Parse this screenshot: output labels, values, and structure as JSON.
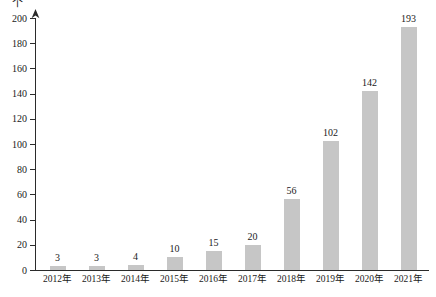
{
  "chart_data": {
    "type": "bar",
    "title": "",
    "subtitle": "",
    "xlabel": "",
    "ylabel": "个",
    "unit_label": "个",
    "categories": [
      "2012年",
      "2013年",
      "2014年",
      "2015年",
      "2016年",
      "2017年",
      "2018年",
      "2019年",
      "2020年",
      "2021年"
    ],
    "values": [
      3,
      3,
      4,
      10,
      15,
      20,
      56,
      102,
      142,
      193
    ],
    "value_labels": [
      "3",
      "3",
      "4",
      "10",
      "15",
      "20",
      "56",
      "102",
      "142",
      "193"
    ],
    "ylim": [
      0,
      200
    ],
    "ytick_values": [
      0,
      20,
      40,
      60,
      80,
      100,
      120,
      140,
      160,
      180,
      200
    ],
    "ytick_labels": [
      "0",
      "20",
      "40",
      "60",
      "80",
      "100",
      "120",
      "140",
      "160",
      "180",
      "200"
    ],
    "grid": false,
    "legend": null,
    "legend_position": "none",
    "bar_color": "#c6c6c6",
    "axis_color": "#2b2b2b",
    "text_color": "#1a1a1a",
    "y_axis_has_arrow": true
  }
}
